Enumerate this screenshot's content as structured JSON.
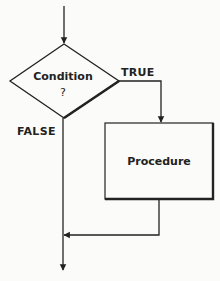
{
  "diagram": {
    "type": "flowchart",
    "colors": {
      "background": "#fbfbf9",
      "stroke": "#222222",
      "text": "#222222"
    },
    "nodes": {
      "decision": {
        "label": "Condition",
        "sublabel": "?"
      },
      "process": {
        "label": "Procedure"
      }
    },
    "edges": {
      "true_label": "TRUE",
      "false_label": "FALSE"
    }
  }
}
